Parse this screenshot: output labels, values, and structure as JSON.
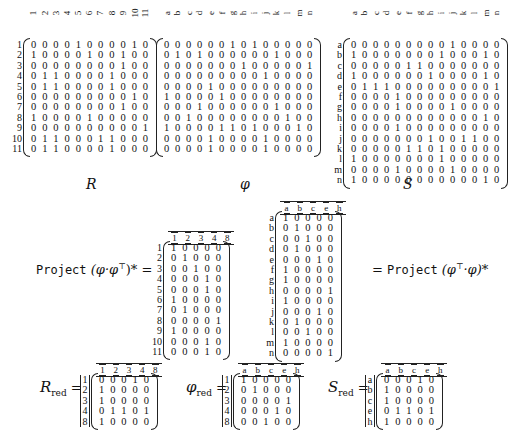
{
  "matrices": {
    "R": {
      "caption": "R",
      "row_labels": [
        "1",
        "2",
        "3",
        "4",
        "5",
        "6",
        "7",
        "8",
        "9",
        "10",
        "11"
      ],
      "col_labels": [
        "1",
        "2",
        "3",
        "4",
        "5",
        "6",
        "7",
        "8",
        "9",
        "10",
        "11"
      ],
      "rows": [
        [
          0,
          0,
          0,
          0,
          1,
          0,
          0,
          0,
          0,
          1,
          0
        ],
        [
          1,
          0,
          0,
          0,
          0,
          1,
          0,
          0,
          1,
          0,
          0
        ],
        [
          0,
          0,
          0,
          0,
          0,
          0,
          0,
          0,
          1,
          0,
          0
        ],
        [
          0,
          1,
          1,
          0,
          0,
          0,
          0,
          1,
          0,
          0,
          0
        ],
        [
          0,
          1,
          1,
          0,
          0,
          0,
          0,
          1,
          0,
          0,
          0
        ],
        [
          0,
          0,
          0,
          0,
          0,
          0,
          0,
          0,
          0,
          1,
          0
        ],
        [
          0,
          0,
          0,
          0,
          0,
          0,
          0,
          0,
          1,
          0,
          0
        ],
        [
          1,
          0,
          0,
          0,
          0,
          1,
          0,
          0,
          0,
          0,
          0
        ],
        [
          0,
          0,
          0,
          0,
          0,
          0,
          0,
          0,
          0,
          0,
          1
        ],
        [
          0,
          1,
          1,
          0,
          0,
          0,
          1,
          1,
          0,
          0,
          0
        ],
        [
          0,
          1,
          1,
          0,
          0,
          0,
          0,
          1,
          0,
          0,
          0
        ]
      ]
    },
    "phi": {
      "caption": "φ",
      "col_labels": [
        "a",
        "b",
        "c",
        "d",
        "e",
        "f",
        "g",
        "h",
        "i",
        "j",
        "k",
        "l",
        "m",
        "n"
      ],
      "rows": [
        [
          0,
          0,
          0,
          0,
          0,
          0,
          1,
          0,
          1,
          0,
          0,
          0,
          0,
          0
        ],
        [
          0,
          1,
          0,
          1,
          0,
          0,
          0,
          0,
          0,
          0,
          1,
          0,
          0,
          0
        ],
        [
          0,
          0,
          0,
          0,
          0,
          0,
          0,
          1,
          0,
          0,
          0,
          0,
          0,
          1
        ],
        [
          0,
          0,
          0,
          0,
          0,
          0,
          0,
          0,
          0,
          1,
          0,
          0,
          0,
          0
        ],
        [
          0,
          0,
          0,
          0,
          1,
          0,
          0,
          0,
          0,
          0,
          0,
          0,
          0,
          0
        ],
        [
          1,
          0,
          0,
          0,
          0,
          1,
          0,
          0,
          0,
          0,
          0,
          0,
          0,
          0
        ],
        [
          0,
          0,
          0,
          1,
          0,
          0,
          0,
          0,
          0,
          0,
          1,
          0,
          0,
          0
        ],
        [
          0,
          0,
          1,
          0,
          0,
          0,
          0,
          0,
          0,
          0,
          0,
          1,
          0,
          0
        ],
        [
          1,
          0,
          0,
          0,
          0,
          1,
          1,
          0,
          1,
          0,
          0,
          0,
          1,
          0
        ],
        [
          0,
          0,
          0,
          0,
          1,
          0,
          0,
          0,
          0,
          1,
          0,
          0,
          0,
          0
        ],
        [
          0,
          0,
          0,
          0,
          1,
          0,
          0,
          0,
          0,
          1,
          0,
          0,
          0,
          0
        ]
      ]
    },
    "S": {
      "caption": "S",
      "row_labels": [
        "a",
        "b",
        "c",
        "d",
        "e",
        "f",
        "g",
        "h",
        "i",
        "j",
        "k",
        "l",
        "m",
        "n"
      ],
      "col_labels": [
        "a",
        "b",
        "c",
        "d",
        "e",
        "f",
        "g",
        "h",
        "i",
        "j",
        "k",
        "l",
        "m",
        "n"
      ],
      "rows": [
        [
          0,
          0,
          0,
          0,
          0,
          0,
          0,
          0,
          0,
          1,
          0,
          0,
          0,
          0
        ],
        [
          1,
          0,
          0,
          0,
          0,
          0,
          0,
          0,
          1,
          0,
          0,
          0,
          1,
          0
        ],
        [
          0,
          0,
          0,
          0,
          0,
          1,
          1,
          0,
          0,
          0,
          0,
          0,
          0,
          0
        ],
        [
          1,
          0,
          0,
          0,
          0,
          0,
          0,
          1,
          0,
          0,
          0,
          0,
          1,
          0
        ],
        [
          0,
          1,
          1,
          1,
          0,
          0,
          0,
          0,
          0,
          0,
          0,
          0,
          0,
          1
        ],
        [
          0,
          0,
          0,
          0,
          1,
          0,
          0,
          0,
          0,
          0,
          0,
          0,
          0,
          0
        ],
        [
          0,
          0,
          0,
          0,
          1,
          0,
          0,
          0,
          0,
          1,
          0,
          0,
          0,
          0
        ],
        [
          0,
          0,
          0,
          0,
          0,
          0,
          0,
          0,
          0,
          0,
          0,
          0,
          1,
          0
        ],
        [
          0,
          0,
          0,
          0,
          1,
          0,
          0,
          0,
          0,
          0,
          0,
          0,
          0,
          0
        ],
        [
          0,
          0,
          0,
          0,
          0,
          0,
          0,
          1,
          0,
          0,
          1,
          1,
          0,
          0
        ],
        [
          0,
          0,
          0,
          0,
          0,
          1,
          1,
          0,
          1,
          0,
          0,
          0,
          0,
          0
        ],
        [
          1,
          0,
          0,
          0,
          0,
          0,
          0,
          0,
          1,
          0,
          0,
          0,
          0,
          0
        ],
        [
          0,
          0,
          0,
          0,
          1,
          0,
          0,
          0,
          0,
          1,
          0,
          0,
          0,
          0
        ],
        [
          1,
          0,
          0,
          0,
          0,
          0,
          0,
          0,
          0,
          0,
          0,
          0,
          1,
          0
        ]
      ]
    },
    "projL": {
      "row_labels": [
        "1",
        "2",
        "3",
        "4",
        "5",
        "6",
        "7",
        "8",
        "9",
        "10",
        "11"
      ],
      "col_labels": [
        "1",
        "2",
        "3",
        "4",
        "8"
      ],
      "rows": [
        [
          1,
          0,
          0,
          0,
          0
        ],
        [
          0,
          1,
          0,
          0,
          0
        ],
        [
          0,
          0,
          1,
          0,
          0
        ],
        [
          0,
          0,
          0,
          1,
          0
        ],
        [
          0,
          0,
          0,
          1,
          0
        ],
        [
          1,
          0,
          0,
          0,
          0
        ],
        [
          0,
          1,
          0,
          0,
          0
        ],
        [
          0,
          0,
          0,
          0,
          1
        ],
        [
          1,
          0,
          0,
          0,
          0
        ],
        [
          0,
          0,
          0,
          1,
          0
        ],
        [
          0,
          0,
          0,
          1,
          0
        ]
      ]
    },
    "projR": {
      "row_labels": [
        "a",
        "b",
        "c",
        "d",
        "e",
        "f",
        "g",
        "h",
        "i",
        "j",
        "k",
        "l",
        "m",
        "n"
      ],
      "col_labels": [
        "a",
        "b",
        "c",
        "e",
        "h"
      ],
      "rows": [
        [
          1,
          0,
          0,
          0,
          0
        ],
        [
          0,
          1,
          0,
          0,
          0
        ],
        [
          0,
          0,
          1,
          0,
          0
        ],
        [
          0,
          1,
          0,
          0,
          0
        ],
        [
          0,
          0,
          0,
          1,
          0
        ],
        [
          1,
          0,
          0,
          0,
          0
        ],
        [
          1,
          0,
          0,
          0,
          0
        ],
        [
          0,
          0,
          0,
          0,
          1
        ],
        [
          1,
          0,
          0,
          0,
          0
        ],
        [
          0,
          0,
          0,
          1,
          0
        ],
        [
          0,
          1,
          0,
          0,
          0
        ],
        [
          0,
          0,
          1,
          0,
          0
        ],
        [
          1,
          0,
          0,
          0,
          0
        ],
        [
          0,
          0,
          0,
          0,
          1
        ]
      ]
    },
    "Rred": {
      "row_labels": [
        "1",
        "2",
        "3",
        "4",
        "8"
      ],
      "col_labels": [
        "1",
        "2",
        "3",
        "4",
        "8"
      ],
      "rows": [
        [
          0,
          0,
          0,
          1,
          0
        ],
        [
          1,
          0,
          0,
          0,
          0
        ],
        [
          1,
          0,
          0,
          0,
          0
        ],
        [
          0,
          1,
          1,
          0,
          1
        ],
        [
          1,
          0,
          0,
          0,
          0
        ]
      ]
    },
    "phired": {
      "row_labels": [
        "1",
        "2",
        "3",
        "4",
        "8"
      ],
      "col_labels": [
        "a",
        "b",
        "c",
        "e",
        "h"
      ],
      "rows": [
        [
          1,
          0,
          0,
          0,
          0
        ],
        [
          0,
          1,
          0,
          0,
          0
        ],
        [
          0,
          0,
          0,
          0,
          1
        ],
        [
          0,
          0,
          0,
          1,
          0
        ],
        [
          0,
          0,
          1,
          0,
          0
        ]
      ]
    },
    "Sred": {
      "row_labels": [
        "a",
        "b",
        "c",
        "e",
        "h"
      ],
      "col_labels": [
        "a",
        "b",
        "c",
        "e",
        "h"
      ],
      "rows": [
        [
          0,
          0,
          0,
          1,
          0
        ],
        [
          1,
          0,
          0,
          0,
          0
        ],
        [
          1,
          0,
          0,
          0,
          0
        ],
        [
          0,
          1,
          1,
          0,
          1
        ],
        [
          1,
          0,
          0,
          0,
          0
        ]
      ]
    }
  },
  "equations": {
    "project_word": "Project",
    "left_expr": "(φ·φ",
    "left_sup": "⊤",
    "left_close": ")* =",
    "right_open": "= ",
    "right_expr": "(φ",
    "right_sup": "⊤",
    "right_close": "·φ)*",
    "Rred_label": "R",
    "Rred_sub": "red",
    "phired_label": "φ",
    "phired_sub": "red",
    "Sred_label": "S",
    "Sred_sub": "red",
    "equals": "="
  }
}
